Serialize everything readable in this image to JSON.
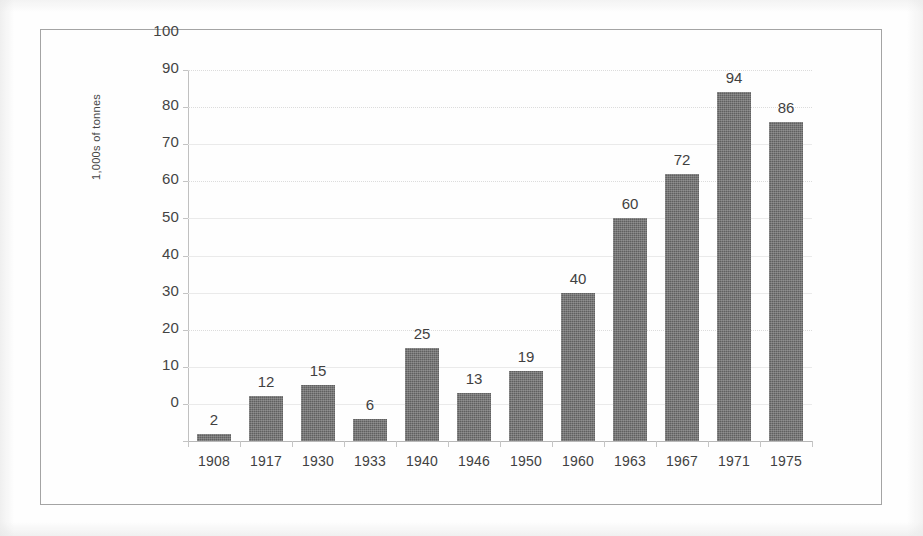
{
  "chart_data": {
    "type": "bar",
    "title": "",
    "xlabel": "",
    "ylabel": "1,000s of tonnes",
    "categories": [
      "1908",
      "1917",
      "1930",
      "1933",
      "1940",
      "1946",
      "1950",
      "1960",
      "1963",
      "1967",
      "1971",
      "1975"
    ],
    "values": [
      2,
      12,
      15,
      6,
      25,
      13,
      19,
      40,
      60,
      72,
      94,
      86
    ],
    "data_labels": [
      "2",
      "12",
      "15",
      "6",
      "25",
      "13",
      "19",
      "40",
      "60",
      "72",
      "94",
      "86"
    ],
    "ylim": [
      0,
      100
    ],
    "ytick_step": 10,
    "ytick_labels": [
      "100",
      "90",
      "80",
      "70",
      "60",
      "50",
      "40",
      "30",
      "20",
      "10",
      "0"
    ],
    "grid": true,
    "grid_axis": "y",
    "legend": "none",
    "bar_color": "#4f4f4f",
    "grid_color": "#e8e8e8",
    "axis_color": "#b9b9b9",
    "text_color": "#2b2b2b",
    "frame_color": "#9a9a9a",
    "background_color": "#fefefe"
  }
}
